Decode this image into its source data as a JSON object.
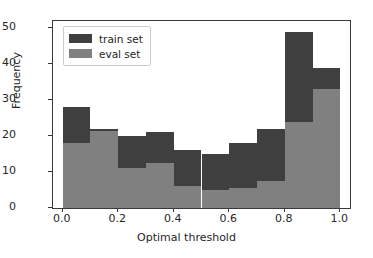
{
  "chart_data": {
    "type": "bar",
    "title": "",
    "subtitle": "",
    "xlabel": "Optimal threshold",
    "ylabel": "Frequency",
    "xlim": [
      -0.035,
      1.035
    ],
    "ylim": [
      0,
      52
    ],
    "grid": false,
    "legend_position": "upper left",
    "bin_edges": [
      0.0,
      0.1,
      0.2,
      0.3,
      0.4,
      0.5,
      0.6,
      0.7,
      0.8,
      0.9,
      1.0
    ],
    "categories": [
      "0.0-0.1",
      "0.1-0.2",
      "0.2-0.3",
      "0.3-0.4",
      "0.4-0.5",
      "0.5-0.6",
      "0.6-0.7",
      "0.7-0.8",
      "0.8-0.9",
      "0.9-1.0"
    ],
    "series": [
      {
        "name": "train set",
        "color": "#3f3f3f",
        "values": [
          28,
          22,
          20,
          21,
          16,
          15,
          18,
          22,
          49,
          39
        ]
      },
      {
        "name": "eval set",
        "color": "#808080",
        "values": [
          18,
          21.5,
          11,
          12.5,
          6,
          5,
          5.5,
          7.5,
          24,
          33
        ]
      }
    ],
    "xticks": [
      {
        "value": 0.0,
        "label": "0.0"
      },
      {
        "value": 0.2,
        "label": "0.2"
      },
      {
        "value": 0.4,
        "label": "0.4"
      },
      {
        "value": 0.6,
        "label": "0.6"
      },
      {
        "value": 0.8,
        "label": "0.8"
      },
      {
        "value": 1.0,
        "label": "1.0"
      }
    ],
    "yticks": [
      {
        "value": 0,
        "label": "0"
      },
      {
        "value": 10,
        "label": "10"
      },
      {
        "value": 20,
        "label": "20"
      },
      {
        "value": 30,
        "label": "30"
      },
      {
        "value": 40,
        "label": "40"
      },
      {
        "value": 50,
        "label": "50"
      }
    ]
  },
  "legend": {
    "items": [
      {
        "label": "train set",
        "color": "#3f3f3f"
      },
      {
        "label": "eval set",
        "color": "#808080"
      }
    ]
  },
  "style": {
    "axis_color": "#3a3a3a",
    "text_color": "#262626",
    "background": "#ffffff"
  }
}
